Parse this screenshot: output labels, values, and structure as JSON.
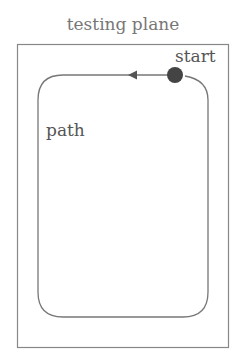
{
  "diagram": {
    "title": "testing plane",
    "labels": {
      "start": "start",
      "path": "path"
    },
    "colors": {
      "stroke": "#666666",
      "dot": "#444444",
      "text": "#666666"
    }
  }
}
